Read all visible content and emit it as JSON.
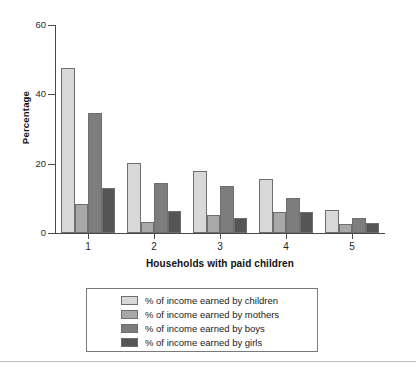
{
  "chart_data": {
    "type": "bar",
    "title": "",
    "xlabel": "Households with paid children",
    "ylabel": "Percentage",
    "categories": [
      "1",
      "2",
      "3",
      "4",
      "5"
    ],
    "ylim": [
      0,
      60
    ],
    "yticks": [
      0,
      20,
      40,
      60
    ],
    "ytick_labels": [
      "0",
      "20",
      "40",
      "60"
    ],
    "grid": false,
    "legend_position": "bottom",
    "series": [
      {
        "name": "% of income earned by children",
        "color": "#d8d8d8",
        "values": [
          47.5,
          20.3,
          17.8,
          15.5,
          6.7
        ]
      },
      {
        "name": "% of income earned by mothers",
        "color": "#a8a8a8",
        "values": [
          8.5,
          3.3,
          5.3,
          6.0,
          2.6
        ]
      },
      {
        "name": "% of income earned by boys",
        "color": "#7d7d7d",
        "values": [
          34.5,
          14.3,
          13.7,
          10.0,
          4.2
        ]
      },
      {
        "name": "% of income earned by girls",
        "color": "#555555",
        "values": [
          13.0,
          6.3,
          4.2,
          6.2,
          2.9
        ]
      }
    ]
  },
  "axes": {
    "y_title": "Percentage",
    "x_title": "Households with paid children",
    "y_tick_labels": [
      "60",
      "40",
      "20",
      "0"
    ],
    "x_tick_labels": [
      "1",
      "2",
      "3",
      "4",
      "5"
    ]
  },
  "legend": {
    "items": [
      {
        "label": "% of income earned by children",
        "color": "#d8d8d8"
      },
      {
        "label": "% of income earned by mothers",
        "color": "#a8a8a8"
      },
      {
        "label": "% of income earned by boys",
        "color": "#7d7d7d"
      },
      {
        "label": "% of income earned by girls",
        "color": "#555555"
      }
    ]
  }
}
